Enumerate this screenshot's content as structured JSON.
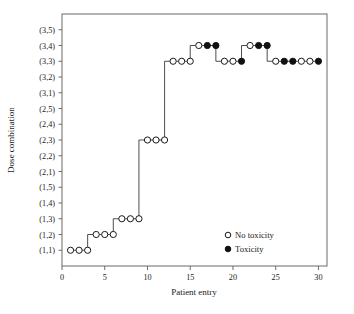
{
  "chart_data": {
    "type": "scatter",
    "title": "",
    "xlabel": "Patient entry",
    "ylabel": "Dose combination",
    "xlim": [
      0,
      31
    ],
    "ylim": [
      0,
      16
    ],
    "xticks": [
      0,
      5,
      10,
      15,
      20,
      25,
      30
    ],
    "xtick_labels": [
      "0",
      "5",
      "10",
      "15",
      "20",
      "25",
      "30"
    ],
    "ytick_labels": [
      "(3,5)",
      "(3,4)",
      "(3,3)",
      "(3,2)",
      "(3,1)",
      "(2,5)",
      "(2,4)",
      "(2,3)",
      "(2,2)",
      "(2,1)",
      "(1,5)",
      "(1,4)",
      "(1,3)",
      "(1,2)",
      "(1,1)"
    ],
    "grid": false,
    "legend_position": "lower-right",
    "legend": [
      {
        "marker": "open-circle",
        "label": "No toxicity"
      },
      {
        "marker": "filled-circle",
        "label": "Toxicity"
      }
    ],
    "series": [
      {
        "name": "Dose assignment path",
        "x": [
          1,
          2,
          3,
          4,
          5,
          6,
          7,
          8,
          9,
          10,
          11,
          12,
          13,
          14,
          15,
          16,
          17,
          18,
          19,
          20,
          21,
          22,
          23,
          24,
          25,
          26,
          27,
          28,
          29,
          30
        ],
        "y_labels": [
          "(1,1)",
          "(1,1)",
          "(1,1)",
          "(1,2)",
          "(1,2)",
          "(1,2)",
          "(1,3)",
          "(1,3)",
          "(1,3)",
          "(2,3)",
          "(2,3)",
          "(2,3)",
          "(3,3)",
          "(3,3)",
          "(3,3)",
          "(3,4)",
          "(3,4)",
          "(3,4)",
          "(3,3)",
          "(3,3)",
          "(3,3)",
          "(3,4)",
          "(3,4)",
          "(3,4)",
          "(3,3)",
          "(3,3)",
          "(3,3)",
          "(3,3)",
          "(3,3)",
          "(3,3)"
        ],
        "toxicity": [
          false,
          false,
          false,
          false,
          false,
          false,
          false,
          false,
          false,
          false,
          false,
          false,
          false,
          false,
          false,
          false,
          true,
          true,
          false,
          false,
          true,
          false,
          true,
          true,
          false,
          true,
          true,
          false,
          false,
          true
        ]
      }
    ],
    "colors": {
      "marker_open_fill": "#ffffff",
      "marker_stroke": "#1a1a1a",
      "marker_filled_fill": "#111111",
      "step_line": "#3a3a3a",
      "axis": "#6b6b6b",
      "background": "#ffffff"
    }
  }
}
